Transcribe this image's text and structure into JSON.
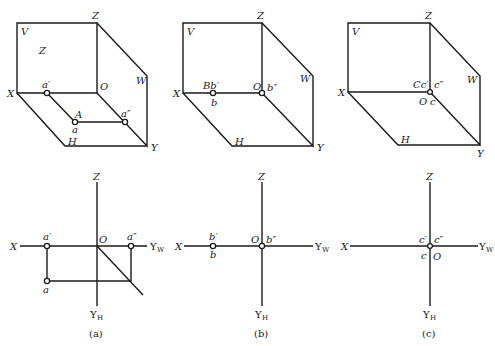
{
  "figure": {
    "panels": [
      {
        "id": "a",
        "caption": "(a)",
        "pictorial": {
          "plane_labels": {
            "V": "V",
            "W": "W",
            "H": "H"
          },
          "axis_labels": {
            "X": "X",
            "Y": "Y",
            "Z": "Z",
            "O": "O"
          },
          "inner_label": "Z",
          "points": {
            "a_prime": "a′",
            "A": "A",
            "a": "a",
            "a_double_prime": "a″"
          }
        },
        "projection": {
          "axis_labels": {
            "X": "X",
            "Z": "Z",
            "O": "O",
            "YW": "Y",
            "YW_sub": "W",
            "YH": "Y",
            "YH_sub": "H"
          },
          "points": {
            "a_prime": "a′",
            "a_double_prime": "a″",
            "a": "a"
          }
        }
      },
      {
        "id": "b",
        "caption": "(b)",
        "pictorial": {
          "plane_labels": {
            "V": "V",
            "W": "W",
            "H": "H"
          },
          "axis_labels": {
            "X": "X",
            "Y": "Y",
            "Z": "Z",
            "O": "O"
          },
          "points": {
            "Bb_prime": "Bb′",
            "b": "b",
            "b_double_prime": "b″"
          }
        },
        "projection": {
          "axis_labels": {
            "X": "X",
            "Z": "Z",
            "O": "O",
            "YW": "Y",
            "YW_sub": "W",
            "YH": "Y",
            "YH_sub": "H"
          },
          "points": {
            "b_prime": "b′",
            "b": "b",
            "b_double_prime": "b″"
          }
        }
      },
      {
        "id": "c",
        "caption": "(c)",
        "pictorial": {
          "plane_labels": {
            "V": "V",
            "W": "W",
            "H": "H"
          },
          "axis_labels": {
            "X": "X",
            "Y": "Y",
            "Z": "Z",
            "O": "O"
          },
          "points": {
            "Cc_prime": "Cc′",
            "c": "c",
            "c_double_prime": "c″"
          }
        },
        "projection": {
          "axis_labels": {
            "X": "X",
            "Z": "Z",
            "O": "O",
            "YW": "Y",
            "YW_sub": "W",
            "YH": "Y",
            "YH_sub": "H"
          },
          "points": {
            "c_prime": "c′",
            "c": "c",
            "c_double_prime": "c″"
          }
        }
      }
    ]
  }
}
